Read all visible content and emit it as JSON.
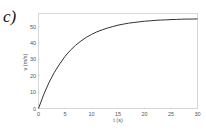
{
  "figure": {
    "panel_label": "c)",
    "cropped_top_text": ", , ,"
  },
  "chart_data": {
    "type": "line",
    "title": "",
    "xlabel": "t (s)",
    "ylabel": "v (m/s)",
    "xlim": [
      0,
      30
    ],
    "ylim": [
      0,
      58
    ],
    "xticks": [
      0,
      5,
      10,
      15,
      20,
      25,
      30
    ],
    "yticks": [
      0,
      10,
      20,
      30,
      40,
      50
    ],
    "grid": false,
    "legend": null,
    "colors": {
      "line": "#333333",
      "frame": "#cfcfcf",
      "text": "#555555"
    },
    "series": [
      {
        "name": "v(t)",
        "x": [
          0,
          1,
          2,
          3,
          4,
          5,
          6,
          7,
          8,
          9,
          10,
          11,
          12,
          13,
          14,
          15,
          16,
          17,
          18,
          19,
          20,
          21,
          22,
          23,
          24,
          25,
          26,
          27,
          28,
          29,
          30
        ],
        "values": [
          0,
          8.7,
          16.0,
          22.1,
          27.2,
          31.8,
          35.5,
          38.6,
          41.2,
          43.4,
          45.2,
          46.8,
          48.0,
          49.1,
          50.0,
          50.9,
          51.5,
          52.1,
          52.5,
          52.9,
          53.3,
          53.5,
          53.8,
          54.0,
          54.1,
          54.3,
          54.4,
          54.5,
          54.6,
          54.6,
          54.7
        ]
      }
    ]
  }
}
